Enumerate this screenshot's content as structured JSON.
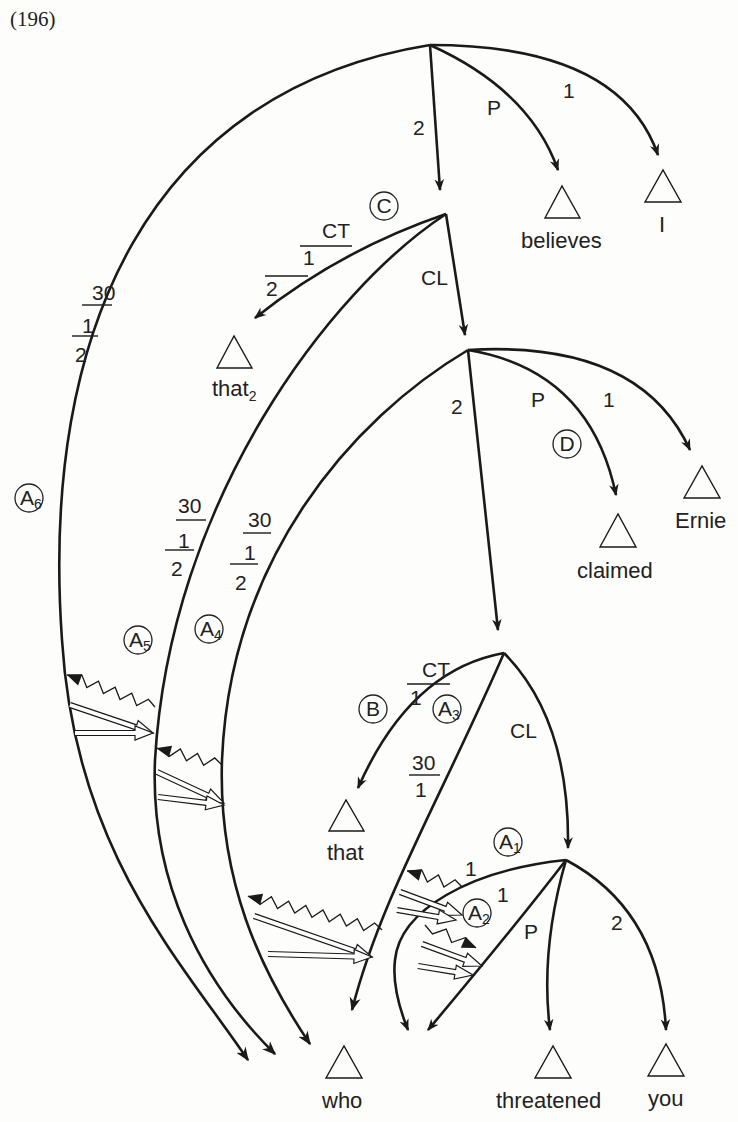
{
  "example_number": "(196)",
  "terminals": {
    "believes": "believes",
    "I": "I",
    "that2": "that",
    "that2_sub": "2",
    "claimed": "claimed",
    "Ernie": "Ernie",
    "that": "that",
    "who": "who",
    "threatened": "threatened",
    "you": "you"
  },
  "arc_labels": {
    "n1_2": "2",
    "n1_P": "P",
    "n1_1": "1",
    "n2_CT_top": "CT",
    "n2_CT_mid": "1",
    "n2_CT_bot": "2",
    "n2_CL": "CL",
    "n3_2": "2",
    "n3_P": "P",
    "n3_1": "1",
    "n4_CT_top": "CT",
    "n4_CT_bot": "1",
    "n4_CL": "CL",
    "a3_top": "30",
    "a3_bot": "1",
    "n5_1a": "1",
    "n5_1b": "1",
    "n5_P": "P",
    "n5_2": "2",
    "a6_top": "30",
    "a6_mid": "1",
    "a6_bot": "2",
    "a5_top": "30",
    "a5_mid": "1",
    "a5_bot": "2",
    "a4_top": "30",
    "a4_mid": "1",
    "a4_bot": "2"
  },
  "circled_labels": {
    "C": "C",
    "D": "D",
    "B": "B",
    "A1": "A",
    "A1_sub": "1",
    "A2": "A",
    "A2_sub": "2",
    "A3": "A",
    "A3_sub": "3",
    "A4": "A",
    "A4_sub": "4",
    "A5": "A",
    "A5_sub": "5",
    "A6": "A",
    "A6_sub": "6"
  }
}
